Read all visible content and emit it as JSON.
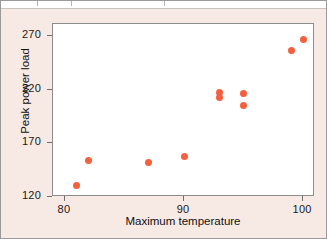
{
  "chart_data": {
    "type": "scatter",
    "title": "",
    "xlabel": "Maximum temperature",
    "ylabel": "Peak power load",
    "xlim": [
      79,
      101
    ],
    "ylim": [
      120,
      281
    ],
    "xticks": [
      80,
      90,
      100
    ],
    "yticks": [
      120,
      170,
      220,
      270
    ],
    "xtick_labels": [
      "80",
      "90",
      "100"
    ],
    "ytick_labels": [
      "120",
      "170",
      "220",
      "270"
    ],
    "grid": false,
    "legend": null,
    "marker": {
      "shape": "circle",
      "color": "#f2603f",
      "size": 7
    },
    "series": [
      {
        "name": "Peak power load vs maximum temperature",
        "points": [
          {
            "x": 81.0,
            "y": 131
          },
          {
            "x": 82.0,
            "y": 154
          },
          {
            "x": 87.0,
            "y": 152
          },
          {
            "x": 90.0,
            "y": 158
          },
          {
            "x": 93.0,
            "y": 217
          },
          {
            "x": 93.0,
            "y": 213
          },
          {
            "x": 95.0,
            "y": 216
          },
          {
            "x": 95.0,
            "y": 205
          },
          {
            "x": 99.0,
            "y": 256
          },
          {
            "x": 100.0,
            "y": 267
          }
        ]
      }
    ]
  },
  "figure": {
    "background_color": "#f7e9e3",
    "plot_background_color": "#ffffff",
    "frame_color": "#8c8c8c"
  }
}
